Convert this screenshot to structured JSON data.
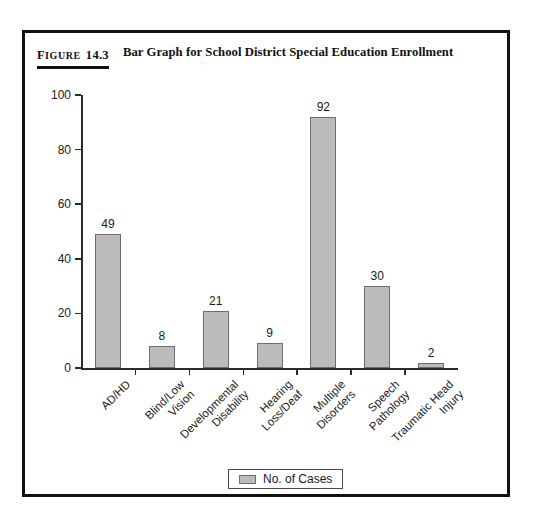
{
  "scan_artifact_text": "",
  "figure": {
    "label_word": "Figure",
    "label_word_first": "F",
    "label_word_rest": "IGURE",
    "number": "14.3",
    "title": "Bar Graph for School District Special Education Enrollment"
  },
  "legend": {
    "label": "No. of Cases",
    "swatch_color": "#bcbcbc",
    "position": "bottom-center"
  },
  "colors": {
    "bar_fill": "#bcbcbc",
    "bar_border": "#6d6d6d",
    "axis": "#2b2b2b",
    "frame": "#111111",
    "text": "#1a1a1a"
  },
  "chart_data": {
    "type": "bar",
    "title": "Bar Graph for School District Special Education Enrollment",
    "xlabel": "",
    "ylabel": "",
    "ylim": [
      0,
      100
    ],
    "yticks": [
      0,
      20,
      40,
      60,
      80,
      100
    ],
    "grid": false,
    "legend_position": "bottom-center",
    "series": [
      {
        "name": "No. of Cases",
        "values": [
          49,
          8,
          21,
          9,
          92,
          30,
          2
        ]
      }
    ],
    "categories": [
      "AD/HD",
      "Blind/Low Vision",
      "Developmental Disability",
      "Hearing Loss/Deaf",
      "Multiple Disorders",
      "Speech Pathology",
      "Traumatic Head Injury"
    ],
    "category_lines": [
      [
        "AD/HD"
      ],
      [
        "Blind/Low",
        "Vision"
      ],
      [
        "Developmental",
        "Disability"
      ],
      [
        "Hearing",
        "Loss/Deaf"
      ],
      [
        "Multiple",
        "Disorders"
      ],
      [
        "Speech",
        "Pathology"
      ],
      [
        "Traumatic Head",
        "Injury"
      ]
    ],
    "values": [
      49,
      8,
      21,
      9,
      92,
      30,
      2
    ],
    "value_labels": [
      "49",
      "8",
      "21",
      "9",
      "92",
      "30",
      "2"
    ]
  }
}
